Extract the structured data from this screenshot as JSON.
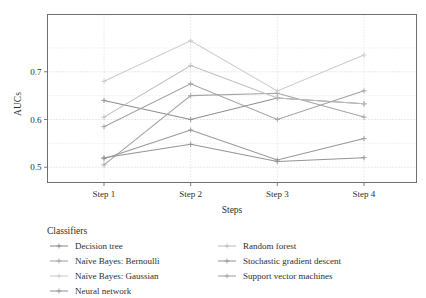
{
  "chart_data": {
    "type": "line",
    "title": "",
    "xlabel": "Steps",
    "ylabel": "AUCs",
    "categories": [
      "Step 1",
      "Step 2",
      "Step 3",
      "Step 4"
    ],
    "ylim": [
      0.468,
      0.82
    ],
    "yticks": [
      0.5,
      0.6,
      0.7
    ],
    "ytick_labels": [
      "0.5",
      "0.6",
      "0.7"
    ],
    "yminor_gridlines": [
      0.55,
      0.65,
      0.75
    ],
    "grid": true,
    "legend_position": "below",
    "legend_title": "Classifiers",
    "series": [
      {
        "name": "Decision tree",
        "color": "#8d8d8d",
        "values": [
          0.64,
          0.6,
          0.645,
          0.633
        ]
      },
      {
        "name": "Naïve Bayes: Bernoulli",
        "color": "#a9a2a2",
        "values": [
          0.505,
          0.65,
          0.655,
          0.605
        ]
      },
      {
        "name": "Naïve Bayes: Gaussian",
        "color": "#cfcaca",
        "values": [
          0.68,
          0.765,
          0.66,
          0.735
        ]
      },
      {
        "name": "Neural network",
        "color": "#989292",
        "values": [
          0.52,
          0.548,
          0.512,
          0.52
        ]
      },
      {
        "name": "Random forest",
        "color": "#c2bcbc",
        "values": [
          0.605,
          0.713,
          0.645,
          0.633
        ]
      },
      {
        "name": "Stochastic gradient descent",
        "color": "#9b9595",
        "values": [
          0.518,
          0.578,
          0.515,
          0.56
        ]
      },
      {
        "name": "Support vector machines",
        "color": "#a5a0a0",
        "values": [
          0.585,
          0.675,
          0.6,
          0.66
        ]
      }
    ]
  },
  "axes": {
    "ylabel": "AUCs",
    "xlabel": "Steps"
  },
  "legend": {
    "title": "Classifiers",
    "column_left": [
      "Decision tree",
      "Naïve Bayes: Bernoulli",
      "Naïve Bayes: Gaussian",
      "Neural network"
    ],
    "column_right": [
      "Random forest",
      "Stochastic gradient descent",
      "Support vector machines"
    ]
  }
}
